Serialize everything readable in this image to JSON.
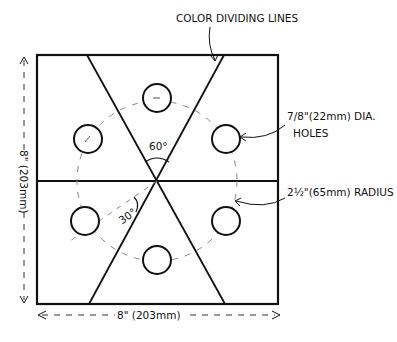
{
  "diagram": {
    "type": "technical-drawing",
    "colors": {
      "line": "#111111",
      "background": "#ffffff",
      "dashed": "#888888"
    },
    "labels": {
      "color_dividing_lines": "COLOR DIVIDING LINES",
      "holes_line1": "7/8\"(22mm) DIA.",
      "holes_line2": "HOLES",
      "radius": "2½\"(65mm) RADIUS",
      "width_dim": "8\" (203mm)",
      "height_dim": "8\" (203mm)",
      "angle_top": "60°",
      "angle_side": "30°"
    },
    "dimensions": {
      "panel_width": "8\" (203mm)",
      "panel_height": "8\" (203mm)",
      "hole_diameter": "7/8\" (22mm)",
      "hole_circle_radius": "2½\" (65mm)",
      "hole_count": 6,
      "angle_between_dividers": "60°",
      "angle_divider_to_horizontal_offset": "30°"
    }
  }
}
